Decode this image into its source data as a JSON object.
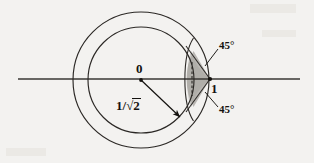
{
  "figure": {
    "type": "geometry-diagram",
    "background_color": "#f3f2f0",
    "ink_color": "#14120f",
    "shade_color": "#b5b2ae",
    "labels": {
      "center_point": "0",
      "unit_point": "1",
      "radius_fraction_numerator": "1/",
      "radius_fraction_radical": "√",
      "radius_radicand": "2",
      "angle_top": "45°",
      "angle_bottom": "45°"
    },
    "geometry": {
      "center": {
        "x": 141,
        "y": 80
      },
      "outer_radius": 68,
      "inner_radius": 53,
      "axis_y": 79,
      "axis_x_start": 18,
      "axis_x_end": 300,
      "unit_point": {
        "x": 210,
        "y": 79
      },
      "cusp_left": {
        "x": 190,
        "y": 79
      }
    }
  }
}
